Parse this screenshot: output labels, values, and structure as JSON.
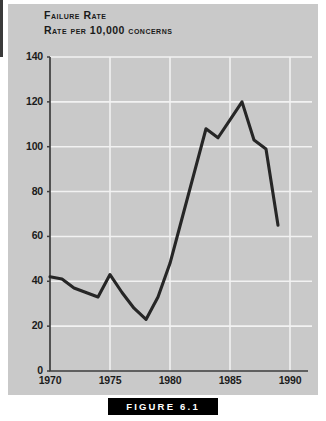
{
  "figure": {
    "caption": "FIGURE 6.1",
    "panel_bg": "#c9c9c9",
    "line_color": "#262626",
    "grid_color": "#f2f2f2",
    "axis_color": "#3d3d3d"
  },
  "chart_data": {
    "type": "line",
    "title": "Failure Rate",
    "subtitle": "Rate per 10,000 concerns",
    "xlabel": "",
    "ylabel": "",
    "xlim": [
      1970,
      1990
    ],
    "ylim": [
      0,
      140
    ],
    "grid": true,
    "legend": "none",
    "xticks": [
      "1970",
      "1975",
      "1980",
      "1985",
      "1990"
    ],
    "xtick_values": [
      1970,
      1975,
      1980,
      1985,
      1990
    ],
    "yticks": [
      "0",
      "20",
      "40",
      "60",
      "80",
      "100",
      "120",
      "140"
    ],
    "ytick_values": [
      0,
      20,
      40,
      60,
      80,
      100,
      120,
      140
    ],
    "x": [
      1970,
      1971,
      1972,
      1973,
      1974,
      1975,
      1976,
      1977,
      1978,
      1979,
      1980,
      1981,
      1982,
      1983,
      1984,
      1985,
      1986,
      1987,
      1988,
      1989
    ],
    "values": [
      42,
      41,
      37,
      35,
      33,
      43,
      35,
      28,
      23,
      33,
      48,
      68,
      88,
      108,
      104,
      112,
      120,
      103,
      99,
      65
    ],
    "series": [
      {
        "name": "Failure Rate",
        "values": [
          42,
          41,
          37,
          35,
          33,
          43,
          35,
          28,
          23,
          33,
          48,
          68,
          88,
          108,
          104,
          112,
          120,
          103,
          99,
          65
        ]
      }
    ]
  }
}
